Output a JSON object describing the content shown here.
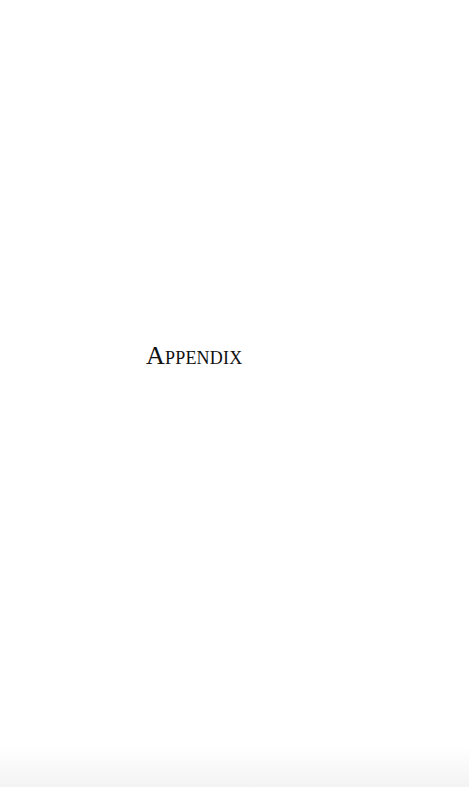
{
  "page": {
    "title": "Appendix"
  },
  "colors": {
    "background": "#ffffff",
    "text": "#111111"
  }
}
